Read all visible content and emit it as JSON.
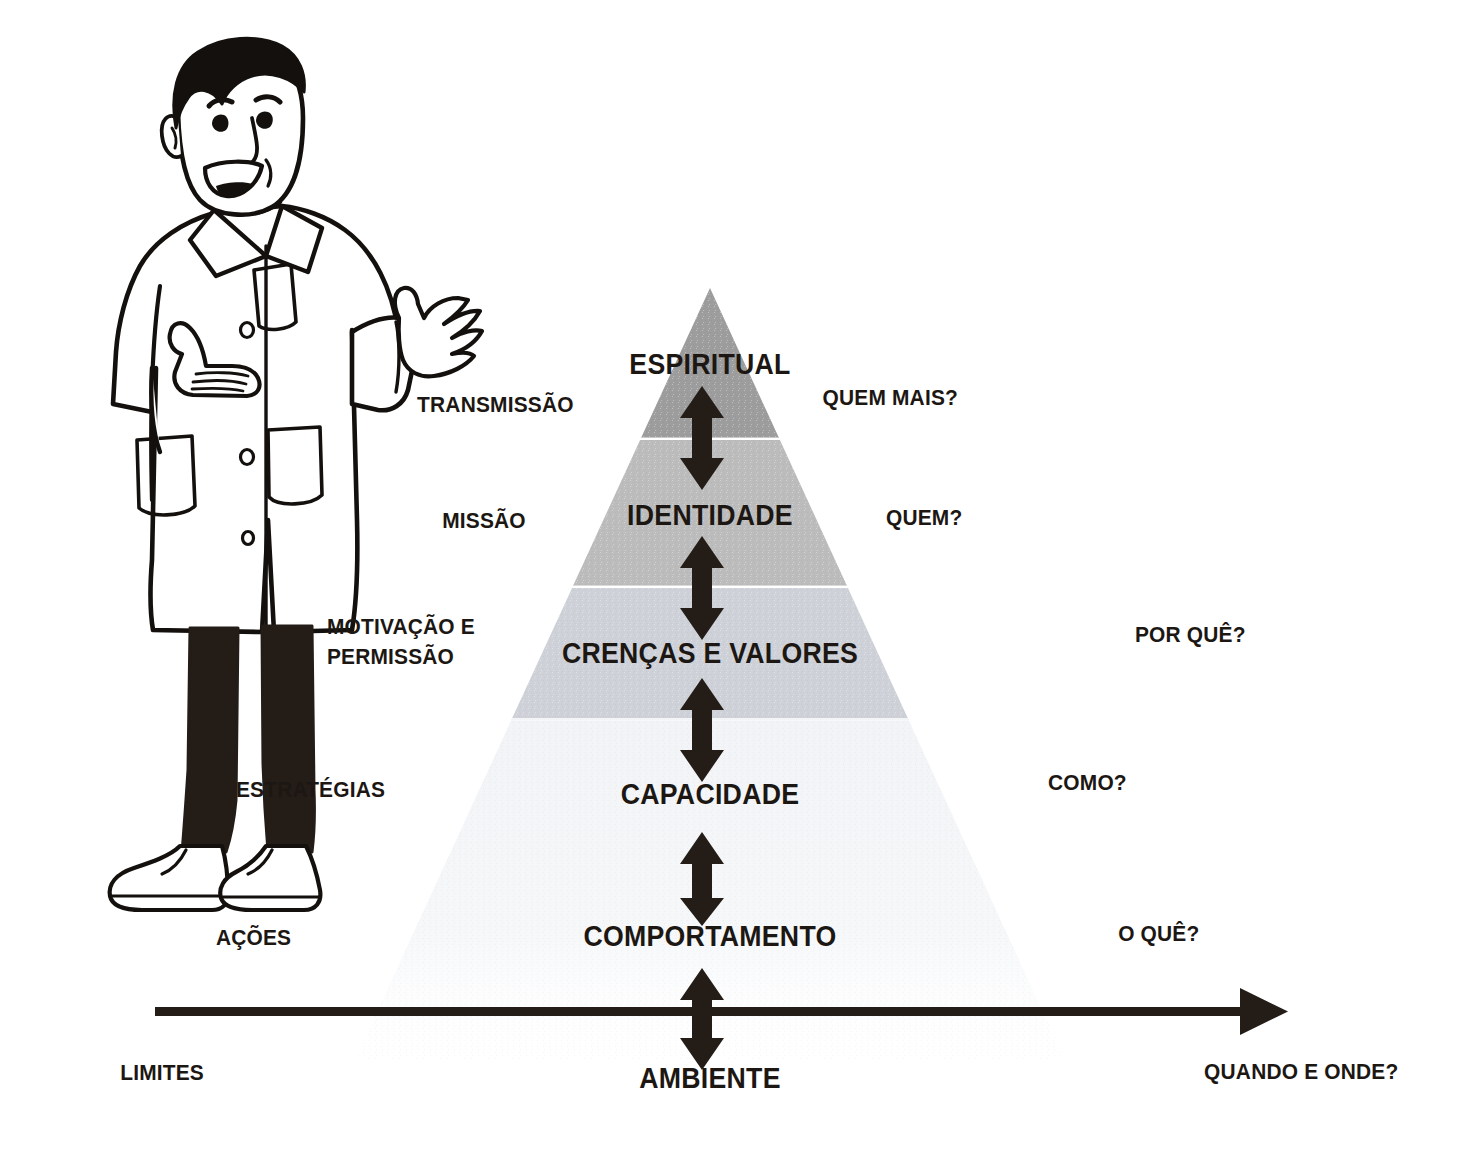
{
  "diagram": {
    "background_color": "#ffffff",
    "text_color": "#1c1713",
    "arrow_color": "#241c17"
  },
  "pyramid": {
    "apex_label": "pyramid-apex",
    "tiers": [
      {
        "name": "ESPIRITUAL",
        "fill": "#9d9d9d"
      },
      {
        "name": "IDENTIDADE",
        "fill": "#bcbcbc"
      },
      {
        "name": "CRENÇAS E VALORES",
        "fill": "#ced2d8"
      },
      {
        "name": "CAPACIDADE",
        "fill": "#f1f3f6"
      }
    ]
  },
  "levels": [
    {
      "name": "ESPIRITUAL",
      "left_label": "TRANSMISSÃO",
      "right_label": "QUEM MAIS?"
    },
    {
      "name": "IDENTIDADE",
      "left_label": "MISSÃO",
      "right_label": "QUEM?"
    },
    {
      "name": "CRENÇAS E VALORES",
      "left_label": "MOTIVAÇÃO E\nPERMISSÃO",
      "right_label": "POR QUÊ?"
    },
    {
      "name": "CAPACIDADE",
      "left_label": "ESTRATÉGIAS",
      "right_label": "COMO?"
    },
    {
      "name": "COMPORTAMENTO",
      "left_label": "AÇÕES",
      "right_label": "O QUÊ?"
    },
    {
      "name": "AMBIENTE",
      "left_label": "LIMITES",
      "right_label": "QUANDO E ONDE?"
    }
  ],
  "baseline": {
    "name": "timeline-arrow",
    "direction": "right"
  },
  "character": {
    "name": "presenter-cartoon",
    "description": "man in lab coat gesturing"
  }
}
